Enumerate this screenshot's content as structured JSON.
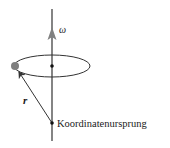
{
  "diagram": {
    "type": "rotation-diagram",
    "labels": {
      "omega": "ω",
      "position_vector": "r",
      "origin": "Koordinatenursprung"
    },
    "colors": {
      "line": "#333333",
      "axis_arrow": "#808080",
      "particle": "#7f7f7f",
      "dots": "#111111"
    }
  }
}
